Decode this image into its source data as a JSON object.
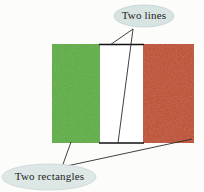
{
  "figure": {
    "background_color": "#fcfcfa",
    "flag": {
      "name": "tricolour-flag",
      "x": 52,
      "y": 44,
      "width": 142,
      "height": 100,
      "bands": [
        {
          "name": "green-band",
          "color": "#5bae3c",
          "x": 52,
          "width": 48
        },
        {
          "name": "white-band",
          "color": "#ffffff",
          "x": 100,
          "width": 43
        },
        {
          "name": "orange-band",
          "color": "#c04a1e",
          "x": 143,
          "width": 51
        }
      ],
      "annotated_lines": {
        "name": "two-lines",
        "color": "#111111",
        "top": {
          "x1": 100,
          "y1": 44,
          "x2": 143,
          "y2": 44
        },
        "bottom": {
          "x1": 100,
          "y1": 143,
          "x2": 143,
          "y2": 143
        }
      }
    },
    "callouts": [
      {
        "id": "two-lines",
        "label": "Two lines",
        "bubble_fill": "#d8e4e2",
        "bubble_stroke": "#c4d2d0",
        "text_color": "#1c1c1c",
        "ellipse": {
          "cx": 144,
          "cy": 16,
          "rx": 30,
          "ry": 11
        },
        "anchor": {
          "x": 133,
          "y": 29
        },
        "leaders": [
          {
            "x1": 133,
            "y1": 29,
            "x2": 110,
            "y2": 45
          },
          {
            "x1": 133,
            "y1": 29,
            "x2": 118,
            "y2": 143
          }
        ]
      },
      {
        "id": "two-rectangles",
        "label": "Two rectangles",
        "bubble_fill": "#dde7e6",
        "bubble_stroke": "#c9d6d4",
        "text_color": "#1c1c1c",
        "ellipse": {
          "cx": 49,
          "cy": 177,
          "rx": 47,
          "ry": 13
        },
        "anchor": {
          "x": 62,
          "y": 167
        },
        "leaders": [
          {
            "x1": 62,
            "y1": 167,
            "x2": 71,
            "y2": 142
          },
          {
            "x1": 62,
            "y1": 167,
            "x2": 192,
            "y2": 139
          }
        ]
      }
    ],
    "leader_color": "#2a2a2a"
  }
}
